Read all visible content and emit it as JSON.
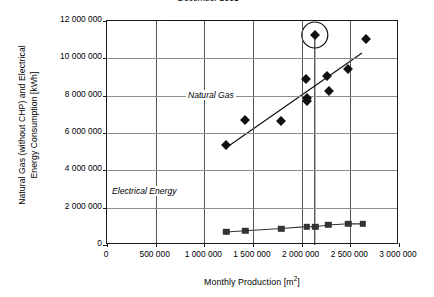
{
  "chart_data": {
    "type": "scatter",
    "title": "",
    "xlabel": "Monthly Production [m2]",
    "xlabel_base": "Monthly Production [m",
    "xlabel_sup": "2",
    "xlabel_tail": "]",
    "ylabel_line1": "Natural Gas (without CHP) and Electrical",
    "ylabel_line2": "Energy Consumption [kWh]",
    "xlim": [
      0,
      3000000
    ],
    "ylim": [
      0,
      12000000
    ],
    "grid": true,
    "legend": "none",
    "xticks": [
      0,
      500000,
      1000000,
      1500000,
      2000000,
      2500000,
      3000000
    ],
    "xticklabels": [
      "0",
      "500 000",
      "1 000 000",
      "1 500 000",
      "2 000 000",
      "2 500 000",
      "3 000 000"
    ],
    "yticks": [
      0,
      2000000,
      4000000,
      6000000,
      8000000,
      10000000,
      12000000
    ],
    "yticklabels": [
      "0",
      "2 000 000",
      "4 000 000",
      "6 000 000",
      "8 000 000",
      "10 000 000",
      "12 000 000"
    ],
    "series": [
      {
        "name": "Natural Gas",
        "marker": "diamond",
        "color": "#111111",
        "points": [
          {
            "x": 1225000,
            "y": 5350000
          },
          {
            "x": 1420000,
            "y": 6720000
          },
          {
            "x": 1790000,
            "y": 6640000
          },
          {
            "x": 2045000,
            "y": 8900000
          },
          {
            "x": 2055000,
            "y": 7900000
          },
          {
            "x": 2050000,
            "y": 7720000
          },
          {
            "x": 2135000,
            "y": 11250000
          },
          {
            "x": 2260000,
            "y": 9050000
          },
          {
            "x": 2280000,
            "y": 8260000
          },
          {
            "x": 2475000,
            "y": 9440000
          },
          {
            "x": 2660000,
            "y": 11050000
          }
        ],
        "trendline": {
          "x0": 1220000,
          "y0": 5200000,
          "x1": 2620000,
          "y1": 10280000
        }
      },
      {
        "name": "Electrical Energy",
        "marker": "square",
        "color": "#333333",
        "connected": true,
        "points": [
          {
            "x": 1225000,
            "y": 700000
          },
          {
            "x": 1420000,
            "y": 760000
          },
          {
            "x": 1790000,
            "y": 880000
          },
          {
            "x": 2050000,
            "y": 985000
          },
          {
            "x": 2140000,
            "y": 980000
          },
          {
            "x": 2275000,
            "y": 1070000
          },
          {
            "x": 2480000,
            "y": 1135000
          },
          {
            "x": 2625000,
            "y": 1130000
          }
        ]
      }
    ],
    "annotations": [
      {
        "name": "december-2001",
        "text": "December 2001",
        "style": "italic",
        "target_x": 2135000,
        "target_y": 11250000,
        "circled": true
      },
      {
        "name": "natural-gas",
        "text": "Natural Gas",
        "style": "italic"
      },
      {
        "name": "electrical-energy",
        "text": "Electrical Energy",
        "style": "italic"
      }
    ]
  }
}
